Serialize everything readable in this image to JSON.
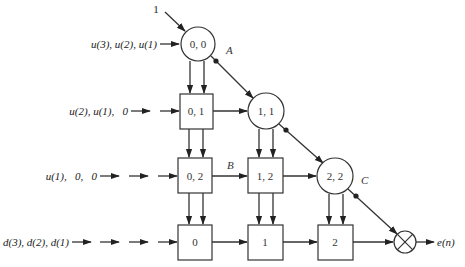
{
  "diagram": {
    "type": "systolic-array-qr-rls",
    "top_input": {
      "label": "1"
    },
    "row_inputs": [
      {
        "id": "row0",
        "label": "u(3), u(2), u(1)"
      },
      {
        "id": "row1",
        "label": "u(2), u(1),   0"
      },
      {
        "id": "row2",
        "label": "u(1),   0,   0"
      },
      {
        "id": "row3",
        "label": "d(3), d(2), d(1)"
      }
    ],
    "boundary_cells": [
      {
        "id": "c00",
        "label": "0, 0",
        "shape": "circle"
      },
      {
        "id": "c11",
        "label": "1, 1",
        "shape": "circle"
      },
      {
        "id": "c22",
        "label": "2, 2",
        "shape": "circle"
      }
    ],
    "internal_cells": [
      {
        "id": "b01",
        "label": "0, 1",
        "shape": "square"
      },
      {
        "id": "b02",
        "label": "0, 2",
        "shape": "square"
      },
      {
        "id": "b12",
        "label": "1, 2",
        "shape": "square"
      }
    ],
    "final_row_cells": [
      {
        "id": "f0",
        "label": "0",
        "shape": "square"
      },
      {
        "id": "f1",
        "label": "1",
        "shape": "square"
      },
      {
        "id": "f2",
        "label": "2",
        "shape": "square"
      }
    ],
    "multiplier": {
      "id": "mult",
      "symbol": "⊗"
    },
    "output": {
      "label": "e(n)"
    },
    "edge_labels": {
      "A": "A",
      "B": "B",
      "C": "C"
    }
  }
}
